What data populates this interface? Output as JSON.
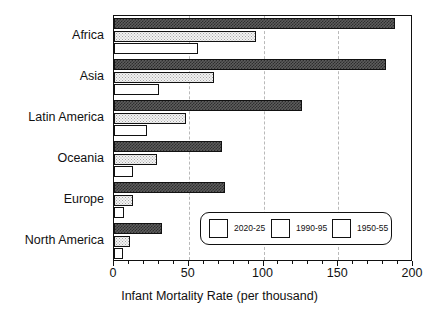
{
  "chart_data": {
    "type": "bar",
    "orientation": "horizontal",
    "title": "",
    "xlabel": "Infant Mortality Rate (per thousand)",
    "ylabel": "",
    "xlim": [
      0,
      200
    ],
    "xticks": [
      0,
      50,
      100,
      150,
      200
    ],
    "xtick_labels": [
      "0",
      "50",
      "100",
      "150",
      "200"
    ],
    "grid": "vertical-dashed",
    "legend_position": "inside-lower-right",
    "categories": [
      "Africa",
      "Asia",
      "Latin America",
      "Oceania",
      "Europe",
      "North America"
    ],
    "series": [
      {
        "name": "2020-25",
        "pattern": "solid-white",
        "color": "#ffffff",
        "values": [
          56,
          30,
          22,
          13,
          7,
          6
        ]
      },
      {
        "name": "1990-95",
        "pattern": "fine-dotted",
        "color": "#f2f2f2",
        "values": [
          95,
          67,
          48,
          29,
          13,
          11
        ]
      },
      {
        "name": "1950-55",
        "pattern": "dark-crosshatch",
        "color": "#4a4a4a",
        "values": [
          188,
          182,
          126,
          72,
          74,
          32
        ]
      }
    ]
  },
  "axis": {
    "x_title": "Infant Mortality Rate (per thousand)",
    "ticks": [
      "0",
      "50",
      "100",
      "150",
      "200"
    ]
  },
  "legend": {
    "items": [
      {
        "label": "2020-25"
      },
      {
        "label": "1990-95"
      },
      {
        "label": "1950-55"
      }
    ]
  }
}
